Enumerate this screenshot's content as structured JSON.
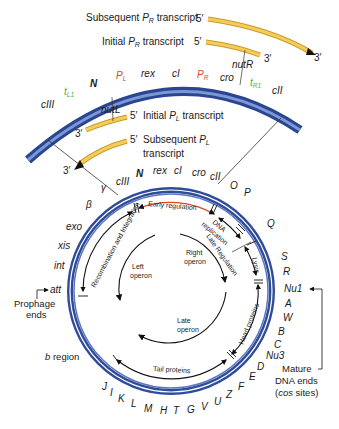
{
  "transcripts": {
    "subsequent_pr": {
      "label_prefix": "Subsequent ",
      "label_p": "P",
      "label_sub": "R",
      "label_suffix": " transcript",
      "five": "5′",
      "three": "3′"
    },
    "initial_pr": {
      "label_prefix": "Initial ",
      "label_p": "P",
      "label_sub": "R",
      "label_suffix": " transcript",
      "five": "5′",
      "three": "3′"
    },
    "initial_pl": {
      "label_prefix": "Initial ",
      "label_p": "P",
      "label_sub": "L",
      "label_suffix": " transcript",
      "five": "5′",
      "three": "3′"
    },
    "subsequent_pl": {
      "label_line1": "Subsequent ",
      "label_p": "P",
      "label_sub": "L",
      "label_line2": "transcript",
      "five": "5′",
      "three": "3′"
    }
  },
  "top_arc_genes": {
    "cIII": "cIII",
    "tL1": "t",
    "tL1_sub": "L1",
    "N": "N",
    "PL": "P",
    "PL_sub": "L",
    "rex": "rex",
    "cI": "cI",
    "PR": "P",
    "PR_sub": "R",
    "cro": "cro",
    "nutR": "nutR",
    "nutL": "nutL",
    "tR1": "t",
    "tR1_sub": "R1",
    "cII": "cII"
  },
  "circle_genes": {
    "top": [
      "cIII",
      "N",
      "rex",
      "cI",
      "cro",
      "cII",
      "O",
      "P"
    ],
    "left": [
      "γ",
      "β",
      "exo",
      "xis",
      "int",
      "att"
    ],
    "right": [
      "Q",
      "S",
      "R",
      "Nu1",
      "A",
      "W",
      "B",
      "C",
      "Nu3",
      "D",
      "E",
      "F"
    ],
    "bottom": [
      "Z",
      "U",
      "V",
      "G",
      "T",
      "H",
      "M",
      "L",
      "K",
      "I",
      "J"
    ]
  },
  "regions": {
    "early_regulation": "Early regulation",
    "recombination": "Recombination and Integration",
    "dna_replication_1": "DNA",
    "dna_replication_2": "replication",
    "late_regulation": "Late Regulation",
    "lysis": "Lysis",
    "head_proteins": "Head proteins",
    "tail_proteins": "Tail proteins"
  },
  "operons": {
    "left_1": "Left",
    "left_2": "operon",
    "right_1": "Right",
    "right_2": "operon",
    "late_1": "Late",
    "late_2": "operon"
  },
  "annotations": {
    "prophage_1": "Prophage",
    "prophage_2": "ends",
    "b_region_italic": "b",
    "b_region_rest": " region",
    "mature_1": "Mature",
    "mature_2": "DNA ends",
    "mature_3_open": "(",
    "mature_3_italic": "cos",
    "mature_3_close": " sites)"
  },
  "colors": {
    "dna_blue": "#3b58a8",
    "transcript_yellow": "#f0c64a",
    "promoter_red": "#e0452a",
    "terminator_green": "#4fae4a"
  }
}
